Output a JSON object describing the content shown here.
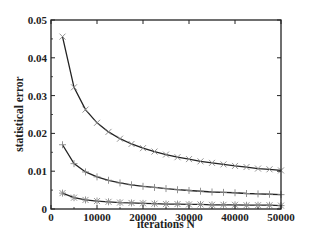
{
  "chart_data": {
    "type": "line",
    "title": "",
    "xlabel": "iterations N",
    "ylabel": "statistical error",
    "xlim": [
      0,
      50000
    ],
    "ylim": [
      0,
      0.05
    ],
    "xticks": [
      0,
      10000,
      20000,
      30000,
      40000,
      50000
    ],
    "xtick_labels": [
      "0",
      "10000",
      "20000",
      "30000",
      "40000",
      "50000"
    ],
    "yticks": [
      0,
      0.01,
      0.02,
      0.03,
      0.04,
      0.05
    ],
    "ytick_labels": [
      "0",
      "0.01",
      "0.02",
      "0.03",
      "0.04",
      "0.05"
    ],
    "grid": false,
    "legend": null,
    "x": [
      2500,
      5000,
      7500,
      10000,
      12500,
      15000,
      17500,
      20000,
      22500,
      25000,
      27500,
      30000,
      32500,
      35000,
      37500,
      40000,
      42500,
      45000,
      47500,
      50000
    ],
    "series": [
      {
        "name": "upper",
        "marker": "x",
        "values": [
          0.0456,
          0.0322,
          0.0263,
          0.0228,
          0.0204,
          0.0186,
          0.0172,
          0.0161,
          0.0152,
          0.0144,
          0.0137,
          0.0132,
          0.0126,
          0.0122,
          0.0118,
          0.0114,
          0.0111,
          0.0107,
          0.0105,
          0.0102
        ]
      },
      {
        "name": "middle",
        "marker": "+",
        "values": [
          0.017,
          0.012,
          0.0098,
          0.0085,
          0.0076,
          0.0069,
          0.0064,
          0.006,
          0.0057,
          0.0054,
          0.0051,
          0.0049,
          0.0047,
          0.0045,
          0.0044,
          0.0043,
          0.0041,
          0.004,
          0.0039,
          0.0038
        ]
      },
      {
        "name": "lower",
        "marker": "*",
        "values": [
          0.0042,
          0.003,
          0.0024,
          0.0021,
          0.0019,
          0.0017,
          0.0016,
          0.0015,
          0.0014,
          0.0013,
          0.0013,
          0.0012,
          0.0012,
          0.0011,
          0.0011,
          0.0011,
          0.001,
          0.001,
          0.001,
          0.0009
        ]
      }
    ],
    "colors": {
      "line": "#222222",
      "marker": "#888888",
      "axis": "#222222"
    }
  }
}
